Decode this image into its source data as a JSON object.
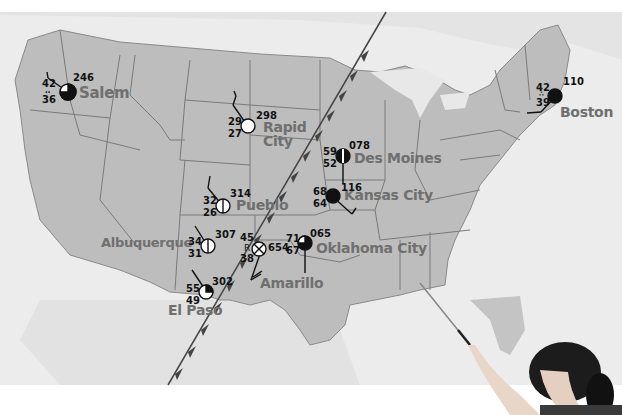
{
  "map": {
    "title": "Weather map of the United States with station models",
    "colors": {
      "land_us": "#bdbdbd",
      "land_other": "#e2e2e2",
      "water": "#efefef",
      "borders": "#7a7a7a",
      "front": "#444444",
      "city_label": "#6f6f6f",
      "station_fill": "#111111"
    },
    "front": {
      "type": "cold-front",
      "description": "Cold front with triangles pointing southeast, running from upper Midwest to Mexico"
    },
    "stations": [
      {
        "city": "Salem",
        "temp": "42",
        "dewpoint": "36",
        "pressure": "246",
        "weather": "drizzle",
        "cloud_cover": "75%"
      },
      {
        "city": "Rapid City",
        "temp": "29",
        "dewpoint": "27",
        "pressure": "298",
        "weather": "",
        "cloud_cover": "clear"
      },
      {
        "city": "Des Moines",
        "temp": "59",
        "dewpoint": "52",
        "pressure": "078",
        "weather": "",
        "cloud_cover": "overcast-broken"
      },
      {
        "city": "Kansas City",
        "temp": "68",
        "dewpoint": "64",
        "pressure": "116",
        "weather": "",
        "cloud_cover": "overcast"
      },
      {
        "city": "Pueblo",
        "temp": "32",
        "dewpoint": "26",
        "pressure": "314",
        "weather": "",
        "cloud_cover": "scattered"
      },
      {
        "city": "Albuquerque",
        "temp": "34",
        "dewpoint": "31",
        "pressure": "307",
        "weather": "",
        "cloud_cover": "scattered"
      },
      {
        "city": "Amarillo",
        "temp": "45",
        "dewpoint": "38",
        "pressure": "654",
        "weather": "thunderstorm",
        "cloud_cover": "obscured"
      },
      {
        "city": "Oklahoma City",
        "temp": "71",
        "dewpoint": "67",
        "pressure": "065",
        "weather": "",
        "cloud_cover": "75%"
      },
      {
        "city": "El Paso",
        "temp": "55",
        "dewpoint": "49",
        "pressure": "302",
        "weather": "",
        "cloud_cover": "25%"
      },
      {
        "city": "Boston",
        "temp": "42",
        "dewpoint": "39",
        "pressure": "110",
        "weather": "rain",
        "cloud_cover": "overcast"
      }
    ],
    "labels": {
      "salem": "Salem",
      "rapid": "Rapid",
      "city": "City",
      "des_moines": "Des Moines",
      "kansas_city": "Kansas City",
      "pueblo": "Pueblo",
      "albuquerque": "Albuquerque",
      "amarillo": "Amarillo",
      "oklahoma_city": "Oklahoma City",
      "el_paso": "El Paso",
      "boston": "Boston"
    },
    "values": {
      "salem_t": "42",
      "salem_d": "36",
      "salem_p": "246",
      "rapid_t": "29",
      "rapid_d": "27",
      "rapid_p": "298",
      "desm_t": "59",
      "desm_d": "52",
      "desm_p": "078",
      "kc_t": "68",
      "kc_d": "64",
      "kc_p": "116",
      "pueblo_t": "32",
      "pueblo_d": "26",
      "pueblo_p": "314",
      "abq_t": "34",
      "abq_d": "31",
      "abq_p": "307",
      "ama_t": "45",
      "ama_d": "38",
      "ama_p": "654",
      "okc_t": "71",
      "okc_d": "67",
      "okc_p": "065",
      "elp_t": "55",
      "elp_d": "49",
      "elp_p": "302",
      "bos_t": "42",
      "bos_d": "39",
      "bos_p": "110"
    },
    "symbols": {
      "drizzle": "‥",
      "rain": "∴",
      "thunderstorm": "R"
    }
  },
  "photo": {
    "description": "Student pointing at map with a pointer"
  }
}
